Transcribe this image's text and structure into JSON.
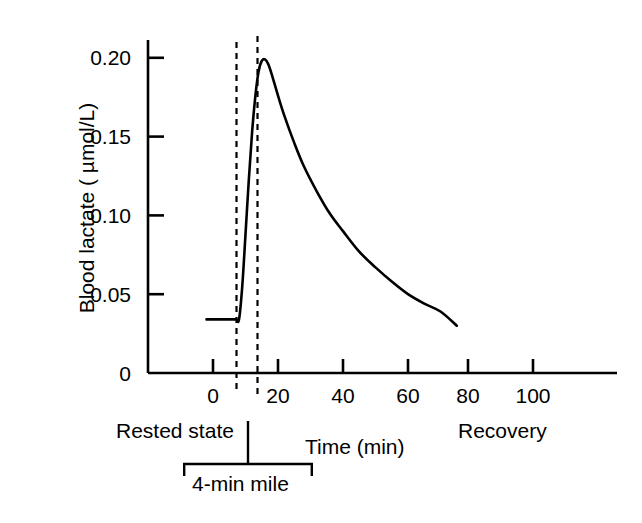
{
  "chart_data": {
    "type": "line",
    "title": "",
    "xlabel": "Time (min)",
    "ylabel": "Blood lactate ( µmol/L)",
    "xlim": [
      -20,
      124
    ],
    "ylim": [
      0,
      0.225
    ],
    "xticks": [
      0,
      20,
      40,
      60,
      80,
      100
    ],
    "xtick_labels": [
      "0",
      "20",
      "40",
      "60",
      "80",
      "100"
    ],
    "yticks": [
      0,
      0.05,
      0.1,
      0.15,
      0.2
    ],
    "ytick_labels": [
      "0",
      "0.05",
      "0.10",
      "0.15",
      "0.20"
    ],
    "grid": false,
    "legend": null,
    "series": [
      {
        "name": "Blood lactate",
        "x": [
          -2,
          4,
          7,
          8,
          9,
          10,
          11,
          12,
          13,
          14,
          15,
          16,
          17,
          18,
          20,
          22,
          25,
          28,
          32,
          36,
          40,
          45,
          50,
          55,
          60,
          65,
          70,
          75
        ],
        "y": [
          0.034,
          0.034,
          0.034,
          0.034,
          0.055,
          0.088,
          0.122,
          0.152,
          0.175,
          0.191,
          0.198,
          0.199,
          0.196,
          0.19,
          0.176,
          0.163,
          0.146,
          0.131,
          0.115,
          0.101,
          0.09,
          0.077,
          0.067,
          0.058,
          0.05,
          0.044,
          0.039,
          0.03
        ]
      }
    ],
    "annotations": [
      {
        "name": "exercise-start-line",
        "type": "vline",
        "x": 7,
        "style": "dashed"
      },
      {
        "name": "exercise-end-line",
        "type": "vline",
        "x": 13.5,
        "style": "dashed"
      },
      {
        "name": "rested-state-label",
        "type": "text",
        "text": "Rested state"
      },
      {
        "name": "recovery-label",
        "type": "text",
        "text": "Recovery"
      },
      {
        "name": "exercise-bracket-label",
        "type": "bracket",
        "text": "4-min mile",
        "x_start": 0,
        "x_end": 36
      }
    ],
    "baseline_value": 0.034,
    "peak_value": 0.199,
    "peak_time_min": 16,
    "end_value": 0.03,
    "end_time_min": 75,
    "line_color": "#000000",
    "axis_color": "#000000",
    "background_color": "#ffffff"
  },
  "axes": {
    "y_title": "Blood lactate ( µmol/L)",
    "x_title": "Time (min)",
    "y_tick_labels": [
      "0.20",
      "0.15",
      "0.10",
      "0.05",
      "0"
    ],
    "x_tick_labels": [
      "0",
      "20",
      "40",
      "60",
      "80",
      "100"
    ]
  },
  "labels": {
    "rested_state": "Rested state",
    "recovery": "Recovery",
    "bracket": "4-min mile"
  }
}
